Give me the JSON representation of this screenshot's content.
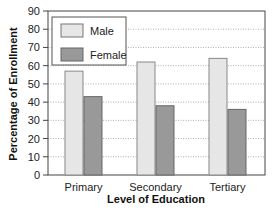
{
  "chart_data": {
    "type": "bar",
    "title": "",
    "xlabel": "Level of Education",
    "ylabel": "Percentage of Enrollment",
    "categories": [
      "Primary",
      "Secondary",
      "Tertiary"
    ],
    "series": [
      {
        "name": "Male",
        "values": [
          57,
          62,
          64
        ],
        "color": "#e6e6e6"
      },
      {
        "name": "Female",
        "values": [
          43,
          38,
          36
        ],
        "color": "#999999"
      }
    ],
    "ylim": [
      0,
      90
    ],
    "yticks": [
      0,
      10,
      20,
      30,
      40,
      50,
      60,
      70,
      80,
      90
    ],
    "grid": "horizontal dotted",
    "legend_position": "upper left, inside plot"
  },
  "legend": {
    "items": [
      {
        "label": "Male"
      },
      {
        "label": "Female"
      }
    ]
  },
  "axes": {
    "xlabel": "Level of Education",
    "ylabel": "Percentage of Enrollment"
  }
}
